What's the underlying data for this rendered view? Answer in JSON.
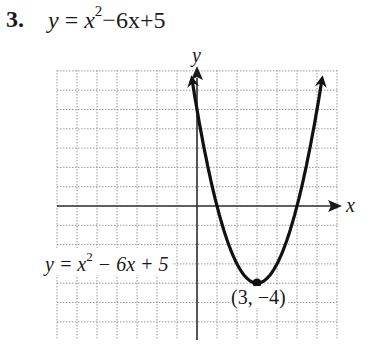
{
  "problem": {
    "number": "3.",
    "equation_lhs": "y",
    "equation_eq": "=",
    "equation_x": "x",
    "equation_exp": "2",
    "equation_rest": "−6x+5"
  },
  "graph": {
    "x_axis_label": "x",
    "y_axis_label": "y",
    "curve_label_prefix": "y = x",
    "curve_label_exp": "2",
    "curve_label_rest": " − 6x + 5",
    "vertex_label": "(3, −4)"
  },
  "chart_data": {
    "type": "line",
    "xlabel": "x",
    "ylabel": "y",
    "grid": true,
    "xlim": [
      -7,
      7
    ],
    "ylim": [
      -7,
      7
    ],
    "function": "x^2 - 6x + 5",
    "series": [
      {
        "name": "y = x^2 − 6x + 5",
        "x": [
          -0.3,
          0,
          1,
          2,
          3,
          4,
          5,
          6,
          6.3
        ],
        "y": [
          6.9,
          5,
          0,
          -3,
          -4,
          -3,
          0,
          5,
          6.9
        ]
      }
    ],
    "annotations": [
      {
        "text": "(3, −4)",
        "x": 3,
        "y": -4,
        "type": "vertex point"
      },
      {
        "text": "y = x^2 − 6x + 5",
        "type": "curve label"
      }
    ],
    "x_intercepts": [
      1,
      5
    ],
    "y_intercept": 5,
    "vertex": [
      3,
      -4
    ]
  }
}
